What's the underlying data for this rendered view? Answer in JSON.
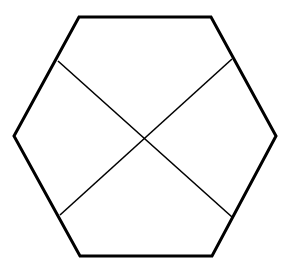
{
  "diagram": {
    "type": "geometric-figure",
    "shape": "hexagon",
    "background": "#ffffff",
    "stroke_color": "#000000",
    "hexagon": {
      "stroke_width": 3,
      "vertices": [
        [
          79,
          17
        ],
        [
          211,
          17
        ],
        [
          276,
          136
        ],
        [
          212,
          256
        ],
        [
          80,
          256
        ],
        [
          14,
          136
        ]
      ]
    },
    "diagonals": {
      "stroke_width": 1.6,
      "lines": [
        {
          "from": [
            58,
            61
          ],
          "to": [
            232,
            217
          ]
        },
        {
          "from": [
            232,
            59
          ],
          "to": [
            60,
            215
          ]
        }
      ],
      "intersection": [
        144,
        138
      ]
    }
  }
}
